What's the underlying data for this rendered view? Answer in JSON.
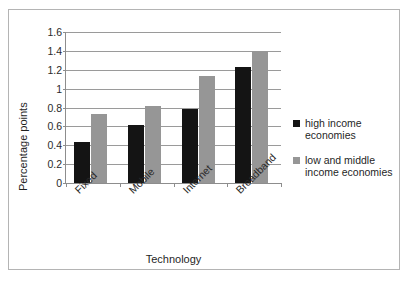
{
  "chart_data": {
    "type": "bar",
    "title": "",
    "xlabel": "Technology",
    "ylabel": "Percentage points",
    "categories": [
      "Fixed",
      "Mobile",
      "Internet",
      "Broadband"
    ],
    "series": [
      {
        "name": "high income economies",
        "color": "#141414",
        "values": [
          0.43,
          0.61,
          0.78,
          1.23
        ]
      },
      {
        "name": "low and middle income economies",
        "color": "#969696",
        "values": [
          0.73,
          0.82,
          1.13,
          1.4
        ]
      }
    ],
    "ylim": [
      0,
      1.6
    ],
    "yticks": [
      0,
      0.2,
      0.4,
      0.6,
      0.8,
      1,
      1.2,
      1.4,
      1.6
    ],
    "ytick_labels": [
      "0",
      "0.2",
      "0.4",
      "0.6",
      "0.8",
      "1",
      "1.2",
      "1.4",
      "1.6"
    ],
    "grid": true,
    "grid_axis": "y",
    "legend_position": "right",
    "xtick_label_rotation": -45
  },
  "legend": {
    "items": [
      {
        "label": "high income economies",
        "color": "#141414"
      },
      {
        "label": "low and middle income economies",
        "color": "#969696"
      }
    ]
  }
}
